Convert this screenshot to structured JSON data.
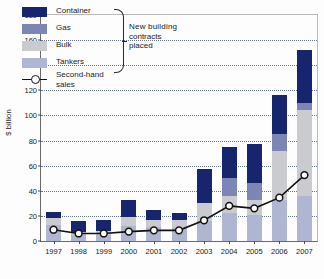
{
  "figure": {
    "ylabel": "$ billion"
  },
  "legend": {
    "items": [
      {
        "label": "Container",
        "color": "#16256e",
        "key": "container"
      },
      {
        "label": "Gas",
        "color": "#7b86b4",
        "key": "gas"
      },
      {
        "label": "Bulk",
        "color": "#c9cbcf",
        "key": "bulk"
      },
      {
        "label": "Tankers",
        "color": "#aeb6d2",
        "key": "tankers"
      }
    ],
    "line_label_1": "Second-hand",
    "line_label_2": "sales",
    "brace_line_1": "New  building",
    "brace_line_2": "contracts",
    "brace_line_3": "placed"
  },
  "chart_data": {
    "type": "bar",
    "title": "",
    "xlabel": "",
    "ylabel": "$ billion",
    "ylim": [
      0,
      180
    ],
    "yticks": [
      0,
      20,
      40,
      60,
      80,
      100,
      120,
      140,
      160,
      180
    ],
    "grid": true,
    "legend_position": "top-left",
    "stacked": true,
    "categories": [
      "1997",
      "1998",
      "1999",
      "2000",
      "2001",
      "2002",
      "2003",
      "2004",
      "2005",
      "2006",
      "2007"
    ],
    "series": [
      {
        "name": "Tankers",
        "color": "#aeb6d2",
        "values": [
          13,
          5,
          5,
          12,
          11,
          10,
          16,
          22,
          21,
          33,
          36
        ]
      },
      {
        "name": "Bulk",
        "color": "#c9cbcf",
        "values": [
          5,
          2,
          3,
          7,
          6,
          7,
          14,
          14,
          12,
          39,
          68
        ]
      },
      {
        "name": "Container",
        "color": "#16256e",
        "values": [
          5,
          9,
          9,
          14,
          8,
          5,
          27,
          25,
          31,
          31,
          48
        ]
      },
      {
        "name": "Gas",
        "color": "#7b86b4",
        "values": [
          0,
          0,
          0,
          0,
          0,
          0,
          0,
          14,
          13,
          13,
          0
        ]
      }
    ],
    "stack_order": [
      "tankers",
      "bulk",
      "gas",
      "container"
    ],
    "stacks": [
      {
        "year": "1997",
        "tankers": 13,
        "bulk": 5,
        "gas": 0,
        "container": 5,
        "total": 23
      },
      {
        "year": "1998",
        "tankers": 5,
        "bulk": 2,
        "gas": 0,
        "container": 9,
        "total": 16
      },
      {
        "year": "1999",
        "tankers": 5,
        "bulk": 3,
        "gas": 0,
        "container": 9,
        "total": 17
      },
      {
        "year": "2000",
        "tankers": 12,
        "bulk": 7,
        "gas": 0,
        "container": 14,
        "total": 33
      },
      {
        "year": "2001",
        "tankers": 11,
        "bulk": 6,
        "gas": 0,
        "container": 8,
        "total": 25
      },
      {
        "year": "2002",
        "tankers": 10,
        "bulk": 7,
        "gas": 0,
        "container": 5,
        "total": 22
      },
      {
        "year": "2003",
        "tankers": 16,
        "bulk": 14,
        "gas": 0,
        "container": 27,
        "total": 57
      },
      {
        "year": "2004",
        "tankers": 22,
        "bulk": 14,
        "gas": 14,
        "container": 25,
        "total": 75
      },
      {
        "year": "2005",
        "tankers": 21,
        "bulk": 12,
        "gas": 13,
        "container": 31,
        "total": 77
      },
      {
        "year": "2006",
        "tankers": 33,
        "bulk": 39,
        "gas": 13,
        "container": 31,
        "total": 116
      },
      {
        "year": "2007",
        "tankers": 36,
        "bulk": 68,
        "gas": 6,
        "container": 42,
        "total": 152
      }
    ],
    "line_series": {
      "name": "Second-hand sales",
      "color": "#121212",
      "marker": "open-circle",
      "values": [
        9,
        6,
        6,
        7.5,
        8.5,
        8.5,
        16.5,
        28,
        26,
        34.5,
        52.5
      ]
    }
  }
}
